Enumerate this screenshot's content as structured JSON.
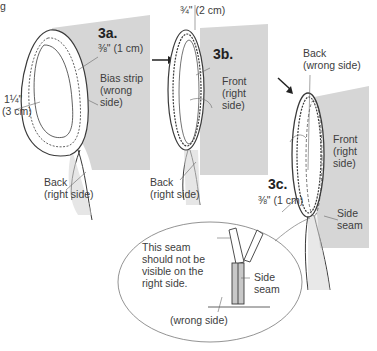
{
  "header": {
    "fragment": "g"
  },
  "panels": [
    {
      "step": "3a.",
      "labels": {
        "seam_allowance": "⅜\" (1 cm)",
        "strip_width_line1": "1¼\"",
        "strip_width_line2": "(3 cm)",
        "bias_line1": "Bias strip",
        "bias_line2": "(wrong",
        "bias_line3": "side)",
        "back_line1": "Back",
        "back_line2": "(right side)"
      }
    },
    {
      "step": "3b.",
      "labels": {
        "measure": "¾\" (2 cm)",
        "front_line1": "Front",
        "front_line2": "(right",
        "front_line3": "side)",
        "back_line1": "Back",
        "back_line2": "(right side)"
      }
    },
    {
      "step": "3c.",
      "labels": {
        "back_line1": "Back",
        "back_line2": "(wrong side)",
        "front_line1": "Front",
        "front_line2": "(right",
        "front_line3": "side)",
        "seam_allowance": "⅜\" (1 cm)",
        "side_seam_line1": "Side",
        "side_seam_line2": "seam"
      }
    }
  ],
  "detail_callout": {
    "note_line1": "This seam",
    "note_line2": "should not be",
    "note_line3": "visible on the",
    "note_line4": "right side.",
    "side_seam_line1": "Side",
    "side_seam_line2": "seam",
    "wrong_side": "(wrong side)"
  },
  "colors": {
    "fabric_gray": "#d6d6d6",
    "outline": "#3a3a3a",
    "background": "#ffffff"
  }
}
